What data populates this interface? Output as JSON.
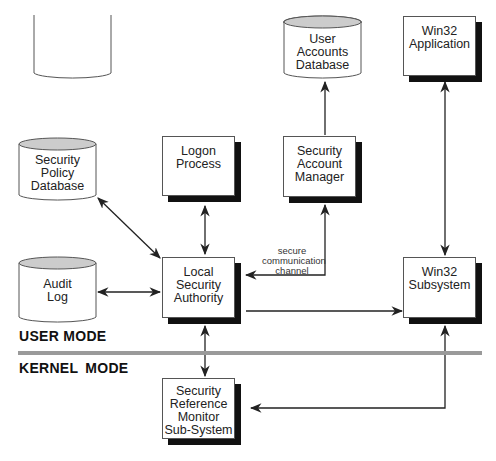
{
  "diagram": {
    "modes": {
      "user": "USER MODE",
      "kernel": "KERNEL MODE"
    },
    "nodes": [
      {
        "id": "user-accounts-db",
        "type": "database",
        "label": "User\nAccounts\nDatabase"
      },
      {
        "id": "win32-app",
        "type": "process",
        "label": "Win32\nApplication"
      },
      {
        "id": "security-policy-db",
        "type": "database",
        "label": "Security\nPolicy\nDatabase"
      },
      {
        "id": "logon-process",
        "type": "process",
        "label": "Logon\nProcess"
      },
      {
        "id": "sam",
        "type": "process",
        "label": "Security\nAccount\nManager"
      },
      {
        "id": "audit-log",
        "type": "database",
        "label": "Audit\nLog"
      },
      {
        "id": "lsa",
        "type": "process",
        "label": "Local\nSecurity\nAuthority"
      },
      {
        "id": "win32-subsystem",
        "type": "process",
        "label": "Win32\nSubsystem"
      },
      {
        "id": "srm",
        "type": "process",
        "label": "Security\nReference\nMonitor\nSub-System"
      }
    ],
    "edges": [
      {
        "from": "security-policy-db",
        "to": "lsa",
        "direction": "both"
      },
      {
        "from": "logon-process",
        "to": "lsa",
        "direction": "both"
      },
      {
        "from": "sam",
        "to": "user-accounts-db",
        "direction": "forward"
      },
      {
        "from": "sam",
        "to": "lsa",
        "direction": "both",
        "label": "secure\ncommunication\nchannel"
      },
      {
        "from": "audit-log",
        "to": "lsa",
        "direction": "both"
      },
      {
        "from": "lsa",
        "to": "win32-subsystem",
        "direction": "forward"
      },
      {
        "from": "win32-app",
        "to": "win32-subsystem",
        "direction": "both"
      },
      {
        "from": "lsa",
        "to": "srm",
        "direction": "both"
      },
      {
        "from": "win32-subsystem",
        "to": "srm",
        "direction": "both"
      }
    ],
    "colors": {
      "line": "#222222",
      "shadow": "#111111",
      "db_top": "#cccccc",
      "divider": "#9a9a9a"
    }
  }
}
